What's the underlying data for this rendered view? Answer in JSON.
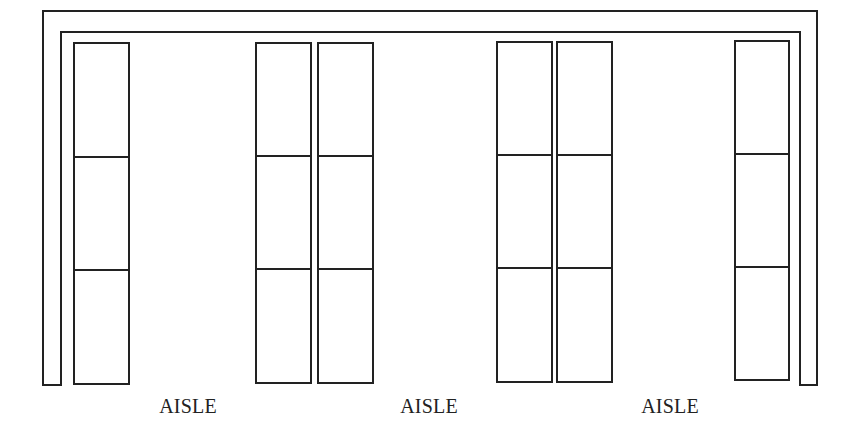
{
  "diagram": {
    "type": "warehouse-floor-plan",
    "colors": {
      "line": "#222222",
      "background": "#ffffff"
    },
    "wall": {
      "outer": {
        "left": 43,
        "top": 11,
        "right": 817,
        "bottom": 385
      },
      "inner": {
        "left": 61,
        "top": 32,
        "right": 800,
        "bottom": 385
      }
    },
    "shelf_units": [
      {
        "id": "A",
        "x": 74,
        "y": 43,
        "w": 55,
        "h": 341,
        "dividers": [
          157,
          270
        ]
      },
      {
        "id": "B",
        "x": 256,
        "y": 43,
        "w": 55,
        "h": 340,
        "dividers": [
          156,
          269
        ]
      },
      {
        "id": "C",
        "x": 318,
        "y": 43,
        "w": 55,
        "h": 340,
        "dividers": [
          156,
          269
        ]
      },
      {
        "id": "D",
        "x": 497,
        "y": 42,
        "w": 55,
        "h": 340,
        "dividers": [
          155,
          268
        ]
      },
      {
        "id": "E",
        "x": 557,
        "y": 42,
        "w": 55,
        "h": 340,
        "dividers": [
          155,
          268
        ]
      },
      {
        "id": "F",
        "x": 735,
        "y": 41,
        "w": 54,
        "h": 339,
        "dividers": [
          154,
          267
        ]
      }
    ],
    "aisles": [
      {
        "label": "AISLE",
        "x": 188
      },
      {
        "label": "AISLE",
        "x": 429
      },
      {
        "label": "AISLE",
        "x": 670
      }
    ]
  }
}
